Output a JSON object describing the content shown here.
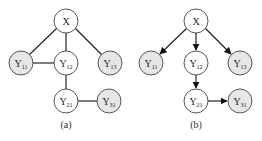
{
  "figures": [
    {
      "id": "a",
      "caption": "(a)",
      "type": "undirected",
      "nodes": [
        {
          "id": "X",
          "main": "X",
          "sub": "",
          "shaded": false
        },
        {
          "id": "Y11",
          "main": "Y",
          "sub": "11",
          "shaded": true
        },
        {
          "id": "Y12",
          "main": "Y",
          "sub": "12",
          "shaded": false
        },
        {
          "id": "Y13",
          "main": "Y",
          "sub": "13",
          "shaded": true
        },
        {
          "id": "Y21",
          "main": "Y",
          "sub": "21",
          "shaded": false
        },
        {
          "id": "Y31",
          "main": "Y",
          "sub": "31",
          "shaded": true
        }
      ],
      "edges": [
        [
          "X",
          "Y11"
        ],
        [
          "X",
          "Y12"
        ],
        [
          "X",
          "Y13"
        ],
        [
          "Y11",
          "Y12"
        ],
        [
          "Y12",
          "Y21"
        ],
        [
          "Y21",
          "Y31"
        ]
      ]
    },
    {
      "id": "b",
      "caption": "(b)",
      "type": "directed",
      "nodes": [
        {
          "id": "X",
          "main": "X",
          "sub": "",
          "shaded": false
        },
        {
          "id": "Y11",
          "main": "Y",
          "sub": "11",
          "shaded": true
        },
        {
          "id": "Y12",
          "main": "Y",
          "sub": "12",
          "shaded": false
        },
        {
          "id": "Y13",
          "main": "Y",
          "sub": "13",
          "shaded": true
        },
        {
          "id": "Y21",
          "main": "Y",
          "sub": "21",
          "shaded": false
        },
        {
          "id": "Y31",
          "main": "Y",
          "sub": "31",
          "shaded": true
        }
      ],
      "edges": [
        [
          "X",
          "Y11"
        ],
        [
          "X",
          "Y12"
        ],
        [
          "X",
          "Y13"
        ],
        [
          "Y12",
          "Y21"
        ],
        [
          "Y21",
          "Y31"
        ]
      ]
    }
  ],
  "colors": {
    "shaded_fill": "#e6e6e6",
    "white_fill": "#ffffff",
    "stroke": "#444444",
    "edge": "#222222"
  }
}
